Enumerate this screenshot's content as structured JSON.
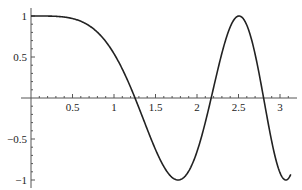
{
  "chart_data": {
    "type": "line",
    "title": "",
    "xlabel": "",
    "ylabel": "",
    "function": "cos(x^2)",
    "xlim": [
      0,
      3.15
    ],
    "ylim": [
      -1.05,
      1.05
    ],
    "grid": false,
    "legend": null,
    "x_ticks": [
      0.5,
      1,
      1.5,
      2,
      2.5,
      3
    ],
    "x_tick_labels": [
      "0.5",
      "1",
      "1.5",
      "2",
      "2.5",
      "3"
    ],
    "y_ticks": [
      1,
      0.5,
      -0.5,
      -1
    ],
    "y_tick_labels": [
      "1",
      "0.5",
      "−0.5",
      "−1"
    ],
    "series": [
      {
        "name": "cos(x^2)",
        "color": "#222222",
        "x": [
          0,
          0.25,
          0.5,
          0.75,
          1.0,
          1.253,
          1.5,
          1.772,
          2.0,
          2.171,
          2.3,
          2.507,
          2.7,
          2.802,
          2.95,
          3.07,
          3.13
        ],
        "y": [
          1,
          0.998,
          0.969,
          0.846,
          0.54,
          0.0,
          -0.628,
          -1.0,
          -0.654,
          0.0,
          0.509,
          1.0,
          0.526,
          0.0,
          -0.766,
          -1.0,
          -0.93
        ]
      }
    ],
    "key_points": {
      "zeros": [
        1.253,
        2.171,
        2.802
      ],
      "minima": [
        [
          1.772,
          -1
        ],
        [
          3.07,
          -1
        ]
      ],
      "maxima": [
        [
          0,
          1
        ],
        [
          2.507,
          1
        ]
      ]
    }
  },
  "layout": {
    "origin_px": [
      31,
      98
    ],
    "px_per_unit_x": 83,
    "px_per_unit_y": 82,
    "x_axis_end_px": 297,
    "y_axis_top_px": 8,
    "y_axis_bottom_px": 188
  }
}
